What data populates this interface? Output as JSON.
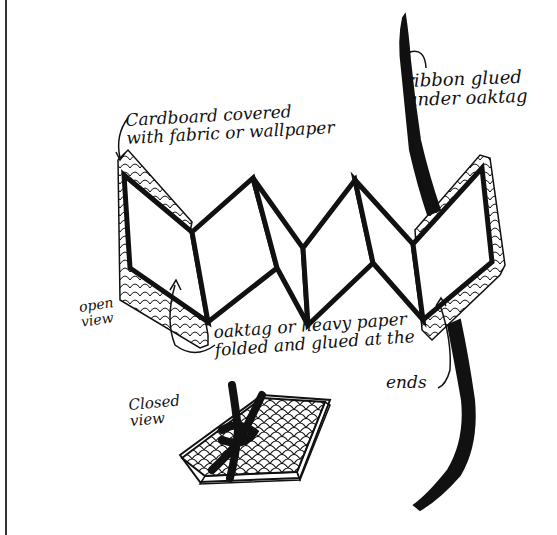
{
  "diagram": {
    "labels": {
      "cardboard_line1": "Cardboard covered",
      "cardboard_line2": "with fabric or wallpaper",
      "ribbon_line1": "ribbon glued",
      "ribbon_line2": "under oaktag",
      "open_line1": "open",
      "open_line2": "view",
      "oaktag_line1": "oaktag or heavy paper",
      "oaktag_line2": "folded and glued at the",
      "oaktag_line3": "ends",
      "closed_line1": "Closed",
      "closed_line2": "view"
    },
    "components": [
      "cardboard-cover-left",
      "cardboard-cover-right",
      "accordion-folded-oaktag",
      "ribbon",
      "closed-book"
    ],
    "colors": {
      "ink": "#111111",
      "paper": "#ffffff"
    }
  }
}
